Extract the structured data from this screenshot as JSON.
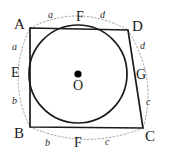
{
  "figure": {
    "canvas": {
      "width": 169,
      "height": 158
    },
    "colors": {
      "stroke": "#1a1a1a",
      "dotted_arc": "#9a9a9a",
      "background": "#ffffff",
      "center_dot": "#000000"
    },
    "vertices": [
      {
        "name": "A",
        "label": "A",
        "x": 30,
        "y": 28,
        "label_x": 14,
        "label_y": 17
      },
      {
        "name": "D",
        "label": "D",
        "x": 128,
        "y": 30,
        "label_x": 132,
        "label_y": 19
      },
      {
        "name": "C",
        "label": "C",
        "x": 143,
        "y": 128,
        "label_x": 145,
        "label_y": 129
      },
      {
        "name": "B",
        "label": "B",
        "x": 30,
        "y": 127,
        "label_x": 14,
        "label_y": 126
      }
    ],
    "circle": {
      "center_x": 78,
      "center_y": 74,
      "radius": 49
    },
    "center_point": {
      "name": "O",
      "label": "O",
      "x": 78,
      "y": 74,
      "label_x": 73,
      "label_y": 79,
      "dot_radius": 3.6
    },
    "tangent_points": [
      {
        "name": "E",
        "label": "E",
        "x": 30,
        "y": 74,
        "label_x": 11,
        "label_y": 66
      },
      {
        "name": "F-top",
        "label": "F",
        "x": 80,
        "y": 28,
        "label_x": 76,
        "label_y": 10
      },
      {
        "name": "G",
        "label": "G",
        "x": 128,
        "y": 82,
        "label_x": 136,
        "label_y": 68
      },
      {
        "name": "F-bottom",
        "label": "F",
        "x": 79,
        "y": 127,
        "label_x": 74,
        "label_y": 136
      }
    ],
    "segment_labels": [
      {
        "name": "a-top",
        "label": "a",
        "x": 48,
        "y": 10
      },
      {
        "name": "d-top",
        "label": "d",
        "x": 100,
        "y": 10
      },
      {
        "name": "a-left",
        "label": "a",
        "x": 12,
        "y": 42
      },
      {
        "name": "d-right",
        "label": "d",
        "x": 140,
        "y": 41
      },
      {
        "name": "b-left",
        "label": "b",
        "x": 12,
        "y": 96
      },
      {
        "name": "c-right",
        "label": "c",
        "x": 146,
        "y": 97
      },
      {
        "name": "b-bottom",
        "label": "b",
        "x": 45,
        "y": 138
      },
      {
        "name": "c-bottom",
        "label": "c",
        "x": 105,
        "y": 137
      }
    ]
  }
}
